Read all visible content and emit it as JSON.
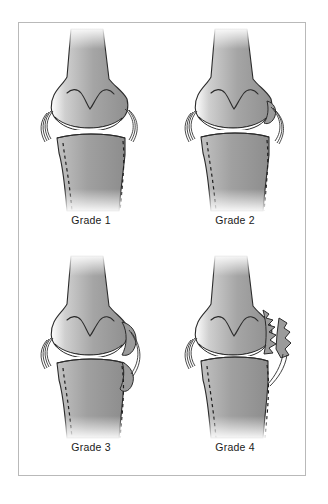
{
  "figure": {
    "frame_border_color": "#b9b9b9",
    "background_color": "#ffffff"
  },
  "style": {
    "bone_fill_light": "#c9c9c9",
    "bone_fill_mid": "#9a9a9a",
    "bone_fill_dark": "#8a8a8a",
    "outline_color": "#2b2b2b",
    "cartilage_color": "#ffffff",
    "label_color": "#1a1a1a"
  },
  "panels": [
    {
      "id": "grade-1",
      "label": "Grade 1",
      "joint_space": "normal",
      "osteophytes": "none",
      "parts": {
        "femur": "femur",
        "tibia": "tibia",
        "joint_space": "joint-space",
        "collateral_ligament": "collateral-ligament",
        "original_contour": "original-contour-dashed"
      }
    },
    {
      "id": "grade-2",
      "label": "Grade 2",
      "joint_space": "slightly narrowed",
      "osteophytes": "small",
      "parts": {
        "femur": "femur",
        "tibia": "tibia",
        "joint_space": "joint-space",
        "collateral_ligament": "collateral-ligament",
        "original_contour": "original-contour-dashed"
      }
    },
    {
      "id": "grade-3",
      "label": "Grade 3",
      "joint_space": "moderately narrowed",
      "osteophytes": "moderate",
      "parts": {
        "femur": "femur",
        "tibia": "tibia",
        "joint_space": "joint-space",
        "collateral_ligament": "collateral-ligament",
        "original_contour": "original-contour-dashed"
      }
    },
    {
      "id": "grade-4",
      "label": "Grade 4",
      "joint_space": "severely narrowed",
      "osteophytes": "large jagged",
      "parts": {
        "femur": "femur",
        "tibia": "tibia",
        "joint_space": "joint-space",
        "collateral_ligament": "collateral-ligament",
        "original_contour": "original-contour-dashed"
      }
    }
  ]
}
